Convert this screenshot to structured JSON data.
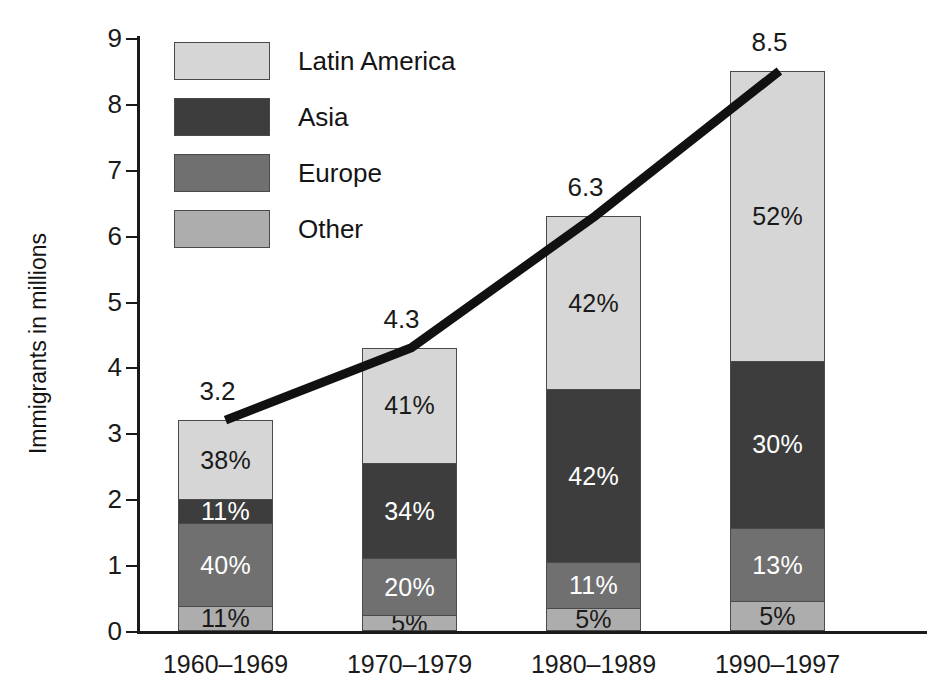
{
  "chart_data": {
    "type": "bar",
    "subtype": "stacked-bar-with-overlay-line",
    "title": "",
    "xlabel": "",
    "ylabel": "Immigrants in millions",
    "ylim": [
      0,
      9
    ],
    "ytick_labels": [
      "0",
      "1",
      "2",
      "3",
      "4",
      "5",
      "6",
      "7",
      "8",
      "9"
    ],
    "ytick_values": [
      0,
      1,
      2,
      3,
      4,
      5,
      6,
      7,
      8,
      9
    ],
    "grid": false,
    "legend_position": "upper-left-inside",
    "categories": [
      "1960–1969",
      "1970–1979",
      "1980–1989",
      "1990–1997"
    ],
    "totals": [
      3.2,
      4.3,
      6.3,
      8.5
    ],
    "total_labels": [
      "3.2",
      "4.3",
      "6.3",
      "8.5"
    ],
    "stack_order_bottom_to_top": [
      "Other",
      "Europe",
      "Asia",
      "Latin America"
    ],
    "series": [
      {
        "name": "Latin America",
        "color": "#d6d6d6",
        "values": [
          38,
          41,
          42,
          52
        ],
        "value_labels": [
          "38%",
          "41%",
          "42%",
          "52%"
        ],
        "label_color": "dark"
      },
      {
        "name": "Asia",
        "color": "#3d3d3d",
        "values": [
          11,
          34,
          42,
          30
        ],
        "value_labels": [
          "11%",
          "34%",
          "42%",
          "30%"
        ],
        "label_color": "light"
      },
      {
        "name": "Europe",
        "color": "#707070",
        "values": [
          40,
          20,
          11,
          13
        ],
        "value_labels": [
          "40%",
          "20%",
          "11%",
          "13%"
        ],
        "label_color": "light"
      },
      {
        "name": "Other",
        "color": "#adadad",
        "values": [
          11,
          5,
          5,
          5
        ],
        "value_labels": [
          "11%",
          "5%",
          "5%",
          "5%"
        ],
        "label_color": "dark"
      }
    ],
    "overlay_line": {
      "name": "Total immigrants trend",
      "color": "#111111",
      "width_px": 9,
      "x_categories": [
        "1960–1969",
        "1970–1979",
        "1980–1989",
        "1990–1997"
      ],
      "y_values": [
        3.2,
        4.3,
        6.3,
        8.5
      ]
    }
  },
  "legend": {
    "items": [
      {
        "label": "Latin America",
        "color": "#d6d6d6"
      },
      {
        "label": "Asia",
        "color": "#3d3d3d"
      },
      {
        "label": "Europe",
        "color": "#707070"
      },
      {
        "label": "Other",
        "color": "#adadad"
      }
    ]
  }
}
